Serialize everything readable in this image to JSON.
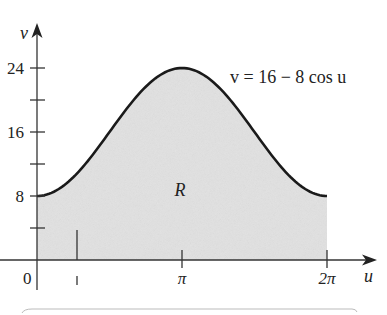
{
  "chart_data": {
    "type": "area",
    "title": "",
    "function_label": "v = 16 − 8 cos u",
    "region_label": "R",
    "xlabel": "u",
    "ylabel": "v",
    "x_ticks": [
      {
        "value": 0,
        "label": "0"
      },
      {
        "value": 3.14159,
        "label": "π"
      },
      {
        "value": 6.28318,
        "label": "2π"
      }
    ],
    "y_ticks": [
      {
        "value": 4,
        "label": ""
      },
      {
        "value": 8,
        "label": "8"
      },
      {
        "value": 12,
        "label": ""
      },
      {
        "value": 16,
        "label": "16"
      },
      {
        "value": 20,
        "label": ""
      },
      {
        "value": 24,
        "label": "24"
      }
    ],
    "xlim": [
      0,
      6.28318
    ],
    "ylim": [
      0,
      24
    ],
    "series": [
      {
        "name": "v = 16 − 8 cos u",
        "x": [
          0,
          0.785,
          1.571,
          2.356,
          3.142,
          3.927,
          4.712,
          5.498,
          6.283
        ],
        "values": [
          8,
          10.34,
          16,
          21.66,
          24,
          21.66,
          16,
          10.34,
          8
        ]
      }
    ],
    "fill_color": "#e2e2e2",
    "curve_color": "#1a1a1a",
    "slice_marker_u": 0.7,
    "grid": false,
    "legend": "none"
  },
  "labels": {
    "y_axis": "v",
    "x_axis": "u",
    "origin": "0",
    "y8": "8",
    "y16": "16",
    "y24": "24",
    "xpi": "π",
    "x2pi": "2π",
    "region": "R",
    "equation": "v = 16 − 8 cos u"
  }
}
